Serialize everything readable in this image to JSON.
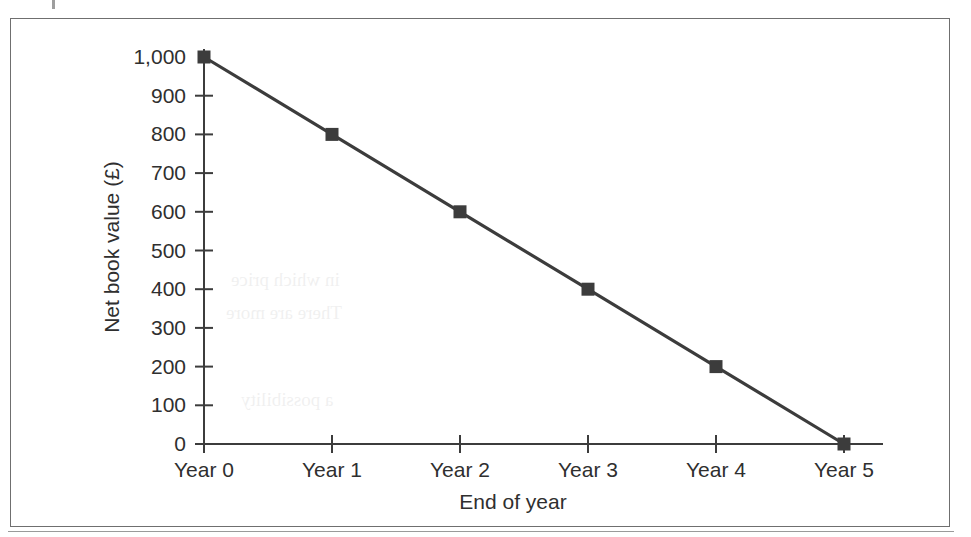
{
  "figure": {
    "border_color": "#6f6f6f",
    "background": "#ffffff"
  },
  "chart_data": {
    "type": "line",
    "title": "",
    "subtitle": "",
    "xlabel": "End of year",
    "ylabel": "Net book value (£)",
    "categories": [
      "Year 0",
      "Year 1",
      "Year 2",
      "Year 3",
      "Year 4",
      "Year 5"
    ],
    "values": [
      1000,
      800,
      600,
      400,
      200,
      0
    ],
    "series": [
      {
        "name": "Net book value",
        "values": [
          1000,
          800,
          600,
          400,
          200,
          0
        ]
      }
    ],
    "ytick_labels": [
      "1,000",
      "900",
      "800",
      "700",
      "600",
      "500",
      "400",
      "300",
      "200",
      "100",
      "0"
    ],
    "ytick_values": [
      1000,
      900,
      800,
      700,
      600,
      500,
      400,
      300,
      200,
      100,
      0
    ],
    "ylim": [
      0,
      1000
    ],
    "grid": false,
    "legend": "none",
    "marker": "square",
    "line_color": "#3c3c3c",
    "marker_color": "#3c3c3c"
  },
  "ghost": {
    "line1": "in which price",
    "line2": "There are more",
    "line3": "a possibility"
  }
}
